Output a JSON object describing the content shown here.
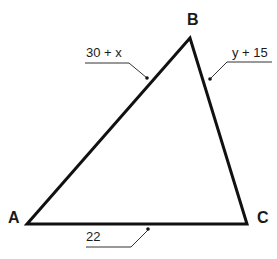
{
  "diagram": {
    "type": "triangle",
    "vertices": [
      {
        "id": "A",
        "label": "A",
        "x": 27,
        "y": 224
      },
      {
        "id": "B",
        "label": "B",
        "x": 190,
        "y": 38
      },
      {
        "id": "C",
        "label": "C",
        "x": 247,
        "y": 224
      }
    ],
    "sides": {
      "AB": {
        "label": "30 + x"
      },
      "BC": {
        "label": "y + 15"
      },
      "AC": {
        "label": "22"
      }
    },
    "colors": {
      "stroke": "#111111",
      "leader": "#333333",
      "background": "#ffffff"
    }
  }
}
